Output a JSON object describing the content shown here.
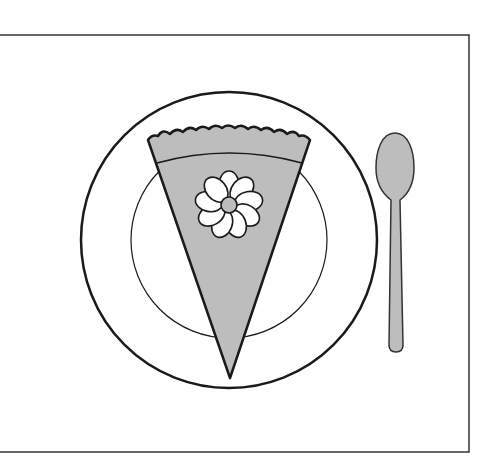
{
  "scene": {
    "description": "Line drawing of a slice of pie on a plate with a spoon",
    "colors": {
      "background": "#ffffff",
      "outline": "#1a1a1a",
      "fill_gray": "#bdbdbd",
      "petal_white": "#ffffff",
      "frame": "#333333"
    },
    "frame": {
      "x": 0,
      "y": 35,
      "width": 469,
      "height": 417
    },
    "plate": {
      "cx": 229,
      "cy": 240,
      "outer_r": 148,
      "inner_r": 98
    },
    "pie_slice": {
      "top_left": [
        148,
        138
      ],
      "top_right": [
        310,
        138
      ],
      "tip": [
        230,
        378
      ]
    },
    "flower": {
      "cx": 229,
      "cy": 205,
      "petals": 9,
      "center_r": 8
    },
    "spoon": {
      "bowl_cx": 395,
      "bowl_cy": 165,
      "handle_bottom": 352
    }
  }
}
